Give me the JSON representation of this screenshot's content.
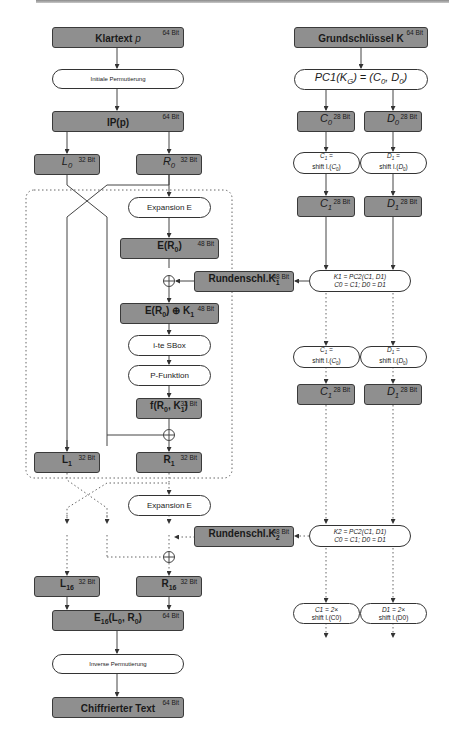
{
  "left_column": {
    "plaintext": {
      "label": "Klartext p",
      "bits": "64 Bit"
    },
    "initial_permutation": {
      "label": "Initiale Permutierung"
    },
    "ip": {
      "label": "IP(p)",
      "bits": "64 Bit"
    },
    "l0": {
      "label": "L0",
      "bits": "32 Bit"
    },
    "r0": {
      "label": "R0",
      "bits": "32 Bit"
    },
    "round1": {
      "expansion": {
        "label": "Expansion E"
      },
      "e_r0": {
        "label": "E(R0)",
        "bits": "48 Bit"
      },
      "xor_key": {
        "label": "E(R0) ⊕ K1",
        "bits": "48 Bit"
      },
      "sbox": {
        "label": "i-te SBox"
      },
      "pfunc": {
        "label": "P-Funktion"
      },
      "f": {
        "label": "f(R0, K1)",
        "bits": "32 Bit"
      },
      "l1": {
        "label": "L1",
        "bits": "32 Bit"
      },
      "r1": {
        "label": "R1",
        "bits": "32 Bit"
      }
    },
    "round2": {
      "expansion": {
        "label": "Expansion E"
      }
    },
    "l16": {
      "label": "L16",
      "bits": "32 Bit"
    },
    "r16": {
      "label": "R16",
      "bits": "32 Bit"
    },
    "e16": {
      "label": "E16(L0, R0)",
      "bits": "64 Bit"
    },
    "inverse_permutation": {
      "label": "Inverse Permutierung"
    },
    "ciphertext": {
      "label": "Chiffrierter Text",
      "bits": "64 Bit"
    }
  },
  "right_column": {
    "key": {
      "label": "Grundschlüssel K",
      "bits": "64 Bit"
    },
    "pc1": {
      "label": "PC1(KG) = (C0, D0)"
    },
    "c0": {
      "label": "C0",
      "bits": "28 Bit"
    },
    "d0": {
      "label": "D0",
      "bits": "28 Bit"
    },
    "shift_c1": {
      "line1": "C1 =",
      "line2": "shift l.(C0)"
    },
    "shift_d1": {
      "line1": "D1 =",
      "line2": "shift l.(D0)"
    },
    "c1": {
      "label": "C1",
      "bits": "28 Bit"
    },
    "d1": {
      "label": "D1",
      "bits": "28 Bit"
    },
    "pc2_k1": {
      "line1": "K1 = PC2(C1, D1)",
      "line2": "C0 = C1; D0 = D1"
    },
    "roundkey1": {
      "label": "Rundenschl.K1",
      "bits": "48 Bit"
    },
    "shift_c1b": {
      "line1": "C1 =",
      "line2": "shift l.(C0)"
    },
    "shift_d1b": {
      "line1": "D1 =",
      "line2": "shift l.(D0)"
    },
    "c1b": {
      "label": "C1",
      "bits": "28 Bit"
    },
    "d1b": {
      "label": "D1",
      "bits": "28 Bit"
    },
    "pc2_k2": {
      "line1": "K2 = PC2(C1, D1)",
      "line2": "C0 = C1; D0 = D1"
    },
    "roundkey2": {
      "label": "Rundenschl.K2",
      "bits": "48 Bit"
    },
    "shift2_c1": {
      "line1": "C1 = 2×",
      "line2": "shift l.(C0)"
    },
    "shift2_d1": {
      "line1": "D1 = 2×",
      "line2": "shift l.(D0)"
    }
  },
  "colors": {
    "box_fill": "#8f8f8f",
    "pill_fill": "#ffffff",
    "stroke": "#333333"
  }
}
